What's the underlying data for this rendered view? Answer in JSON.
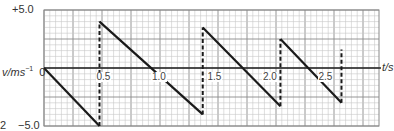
{
  "chart_data": {
    "type": "line",
    "title": "",
    "xlabel": "t/s",
    "ylabel": "v/ms⁻¹",
    "xlim": [
      0,
      3.0
    ],
    "ylim": [
      -5.0,
      5.0
    ],
    "grid": true,
    "y_tick_labels": [
      "+5.0",
      "0",
      "-5.0"
    ],
    "x_tick_labels": [
      "0.5",
      "1.0",
      "1.5",
      "2.0",
      "2.5"
    ],
    "x_ticks": [
      0.5,
      1.0,
      1.5,
      2.0,
      2.5
    ],
    "series": [
      {
        "name": "velocity",
        "style": "solid",
        "segments": [
          [
            [
              0.0,
              0.0
            ],
            [
              0.5,
              -5.0
            ]
          ],
          [
            [
              0.5,
              4.0
            ],
            [
              1.43,
              -4.0
            ]
          ],
          [
            [
              1.43,
              3.5
            ],
            [
              2.13,
              -3.3
            ]
          ],
          [
            [
              2.13,
              2.5
            ],
            [
              2.68,
              -3.0
            ]
          ]
        ]
      },
      {
        "name": "bounce-jumps",
        "style": "dashed",
        "segments": [
          [
            [
              0.5,
              -5.0
            ],
            [
              0.5,
              4.0
            ]
          ],
          [
            [
              1.43,
              -4.0
            ],
            [
              1.43,
              3.5
            ]
          ],
          [
            [
              2.13,
              -3.3
            ],
            [
              2.13,
              2.5
            ]
          ],
          [
            [
              2.68,
              -3.0
            ],
            [
              2.68,
              1.6
            ]
          ]
        ]
      }
    ]
  },
  "labels": {
    "y_top": "+5.0",
    "y_zero": "0",
    "y_bottom": "−5.0",
    "y_axis": "v/ms",
    "y_axis_sup": "−1",
    "x_axis": "t/s",
    "stray_left": "2"
  },
  "colors": {
    "grid_minor": "#c8c8c8",
    "grid_major": "#8a8a8a",
    "axis": "#222222",
    "line": "#1a1a1a"
  }
}
